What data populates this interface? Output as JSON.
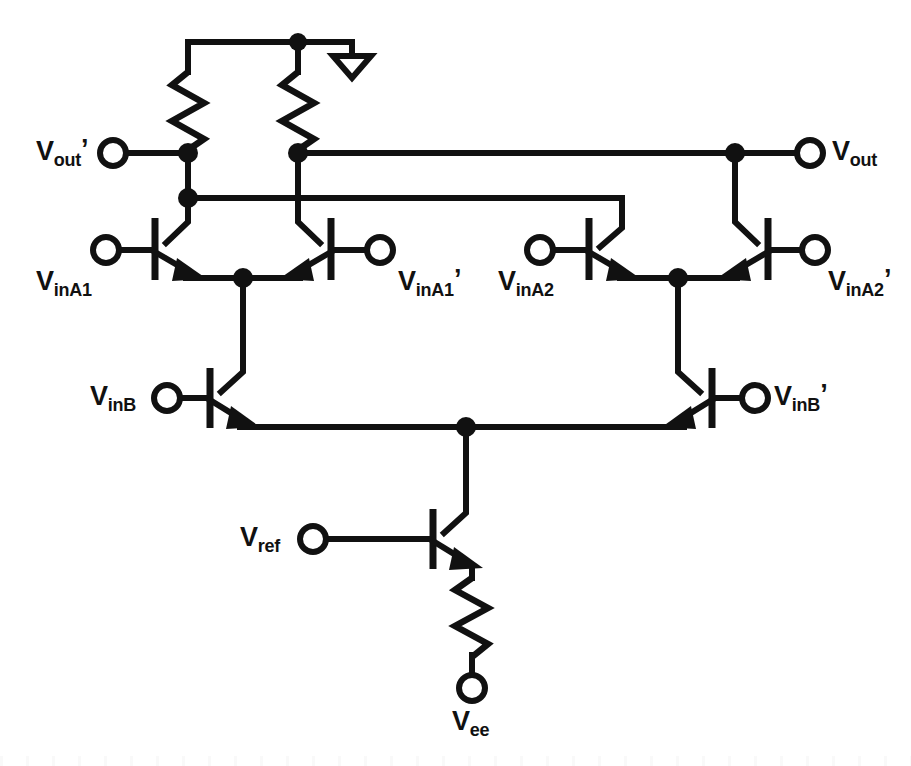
{
  "diagram": {
    "kind": "circuit-schematic",
    "background_color": "#ffffff",
    "line_color": "#111111",
    "line_width": 6
  },
  "labels": {
    "vout_prime": {
      "base": "V",
      "sub": "out",
      "prime": "’",
      "text": "Vout'"
    },
    "vout": {
      "base": "V",
      "sub": "out",
      "prime": "",
      "text": "Vout"
    },
    "vinA1": {
      "base": "V",
      "sub": "inA1",
      "prime": "",
      "text": "VinA1"
    },
    "vinA1_prime": {
      "base": "V",
      "sub": "inA1",
      "prime": "’",
      "text": "VinA1'"
    },
    "vinA2": {
      "base": "V",
      "sub": "inA2",
      "prime": "",
      "text": "VinA2"
    },
    "vinA2_prime": {
      "base": "V",
      "sub": "inA2",
      "prime": "’",
      "text": "VinA2'"
    },
    "vinB": {
      "base": "V",
      "sub": "inB",
      "prime": "",
      "text": "VinB"
    },
    "vinB_prime": {
      "base": "V",
      "sub": "inB",
      "prime": "’",
      "text": "VinB'"
    },
    "vref": {
      "base": "V",
      "sub": "ref",
      "prime": "",
      "text": "Vref"
    },
    "vee": {
      "base": "V",
      "sub": "ee",
      "prime": "",
      "text": "Vee"
    }
  },
  "components": {
    "resistors": [
      {
        "name": "load-resistor-left",
        "orientation": "vertical"
      },
      {
        "name": "load-resistor-right",
        "orientation": "vertical"
      },
      {
        "name": "emitter-degeneration-resistor",
        "orientation": "vertical"
      }
    ],
    "transistors": [
      {
        "name": "transistor-Q1",
        "type": "npn",
        "input": "VinA1",
        "mirrored": false
      },
      {
        "name": "transistor-Q2",
        "type": "npn",
        "input": "VinA1'",
        "mirrored": true
      },
      {
        "name": "transistor-Q3",
        "type": "npn",
        "input": "VinA2",
        "mirrored": false
      },
      {
        "name": "transistor-Q4",
        "type": "npn",
        "input": "VinA2'",
        "mirrored": true
      },
      {
        "name": "transistor-Q5",
        "type": "npn",
        "input": "VinB",
        "mirrored": false
      },
      {
        "name": "transistor-Q6",
        "type": "npn",
        "input": "VinB'",
        "mirrored": true
      },
      {
        "name": "transistor-Q7",
        "type": "npn",
        "input": "Vref",
        "mirrored": false
      }
    ],
    "terminals": [
      "Vout'",
      "Vout",
      "VinA1",
      "VinA1'",
      "VinA2",
      "VinA2'",
      "VinB",
      "VinB'",
      "Vref",
      "Vee"
    ],
    "ground": {
      "name": "ground-symbol",
      "style": "open-triangle"
    },
    "junction_count": 9
  }
}
